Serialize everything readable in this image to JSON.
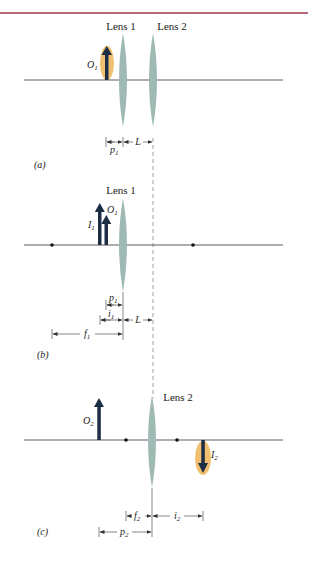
{
  "colors": {
    "top_rule": "#9b3a48",
    "axis": "#333333",
    "lens": "#9fbab5",
    "arrow": "#1c2e45",
    "highlight": "#f0c070",
    "dashed": "#888888",
    "text": "#222222"
  },
  "panels": [
    {
      "id": "a",
      "caption": "(a)",
      "lens_labels": [
        "Lens 1",
        "Lens 2"
      ],
      "objects": [
        {
          "symbol": "O",
          "sub": "1",
          "direction": "up",
          "highlighted": true
        }
      ],
      "dimensions": [
        {
          "symbol": "p",
          "sub": "1"
        },
        {
          "symbol": "L",
          "sub": ""
        }
      ]
    },
    {
      "id": "b",
      "caption": "(b)",
      "lens_labels": [
        "Lens 1"
      ],
      "objects": [
        {
          "symbol": "O",
          "sub": "1",
          "direction": "up",
          "highlighted": false
        },
        {
          "symbol": "I",
          "sub": "1",
          "direction": "up",
          "highlighted": false
        }
      ],
      "focal_points": 2,
      "dimensions": [
        {
          "symbol": "p",
          "sub": "1"
        },
        {
          "symbol": "i",
          "sub": "1"
        },
        {
          "symbol": "L",
          "sub": ""
        },
        {
          "symbol": "f",
          "sub": "1"
        }
      ]
    },
    {
      "id": "c",
      "caption": "(c)",
      "lens_labels": [
        "Lens 2"
      ],
      "objects": [
        {
          "symbol": "O",
          "sub": "2",
          "direction": "up",
          "highlighted": false
        },
        {
          "symbol": "I",
          "sub": "2",
          "direction": "down",
          "highlighted": true
        }
      ],
      "focal_points": 2,
      "dimensions": [
        {
          "symbol": "f",
          "sub": "2"
        },
        {
          "symbol": "i",
          "sub": "2"
        },
        {
          "symbol": "p",
          "sub": "2"
        }
      ]
    }
  ]
}
